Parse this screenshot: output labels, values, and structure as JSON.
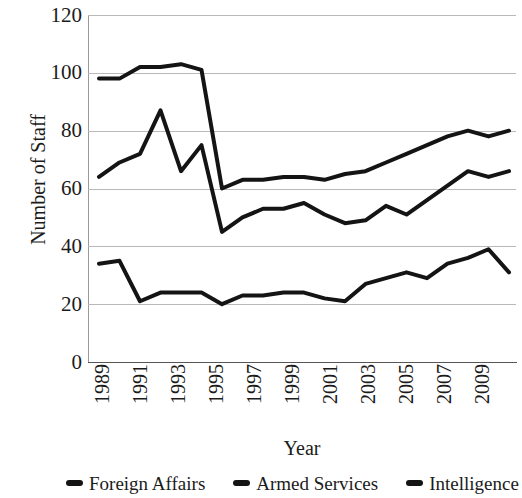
{
  "chart_data": {
    "type": "line",
    "title": "",
    "xlabel": "Year",
    "ylabel": "Number of Staff",
    "grid": true,
    "legend_position": "bottom",
    "xlim": [
      1989,
      2009
    ],
    "ylim": [
      0,
      120
    ],
    "yticks": [
      120,
      100,
      80,
      60,
      40,
      20,
      0
    ],
    "xticks": [
      "1989",
      "1991",
      "1993",
      "1995",
      "1997",
      "1999",
      "2001",
      "2003",
      "2005",
      "2007",
      "2009"
    ],
    "x": [
      1989,
      1990,
      1991,
      1992,
      1993,
      1994,
      1995,
      1996,
      1997,
      1998,
      1999,
      2000,
      2001,
      2002,
      2003,
      2004,
      2005,
      2006,
      2007,
      2008,
      2009
    ],
    "series": [
      {
        "name": "Foreign Affairs",
        "color": "#141414",
        "values": [
          98,
          98,
          102,
          102,
          103,
          101,
          60,
          63,
          63,
          64,
          64,
          63,
          65,
          66,
          69,
          72,
          75,
          78,
          80,
          78,
          80
        ]
      },
      {
        "name": "Armed Services",
        "color": "#141414",
        "values": [
          64,
          69,
          72,
          87,
          66,
          75,
          45,
          50,
          53,
          53,
          55,
          51,
          48,
          49,
          54,
          51,
          56,
          61,
          66,
          64,
          66
        ]
      },
      {
        "name": "Intelligence",
        "color": "#141414",
        "values": [
          34,
          35,
          21,
          24,
          24,
          24,
          20,
          23,
          23,
          24,
          24,
          22,
          21,
          27,
          29,
          31,
          29,
          34,
          36,
          39,
          31
        ]
      }
    ]
  },
  "legend": {
    "items": [
      {
        "label": "Foreign Affairs"
      },
      {
        "label": "Armed Services"
      },
      {
        "label": "Intelligence"
      }
    ]
  }
}
